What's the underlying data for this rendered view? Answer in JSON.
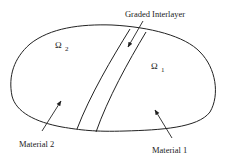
{
  "diagram": {
    "labels": {
      "interlayer": "Graded Interlayer",
      "omega2_symbol": "Ω",
      "omega2_sub": "2",
      "omega1_symbol": "Ω",
      "omega1_sub": "1",
      "material2": "Material 2",
      "material1": "Material 1"
    },
    "colors": {
      "stroke": "#222222",
      "background": "#ffffff"
    }
  }
}
